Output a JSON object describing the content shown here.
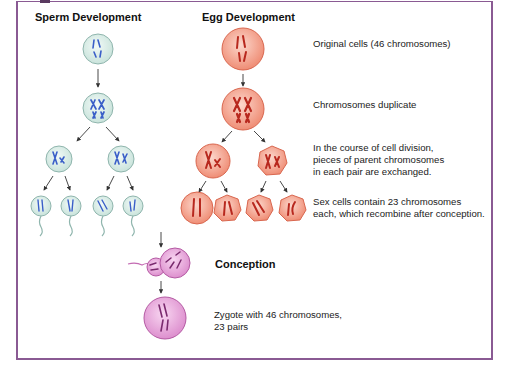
{
  "headings": {
    "sperm": "Sperm Development",
    "egg": "Egg Development",
    "conception": "Conception"
  },
  "steps": [
    {
      "lines": [
        "Original cells (46 chromosomes)"
      ]
    },
    {
      "lines": [
        "Chromosomes duplicate"
      ]
    },
    {
      "lines": [
        "In the course of cell division,",
        "pieces of parent chromosomes",
        "in each pair are exchanged."
      ]
    },
    {
      "lines": [
        "Sex cells contain 23 chromosomes",
        "each, which recombine after conception."
      ]
    }
  ],
  "zygote": {
    "lines": [
      "Zygote with 46 chromosomes,",
      "23 pairs"
    ]
  },
  "colors": {
    "frame": "#8a5a93",
    "sperm_cell_fill": "#dcefe8",
    "sperm_cell_stroke": "#8fb5ad",
    "sperm_chromosome": "#3a5fc8",
    "egg_cell_fill": "#f4a793",
    "egg_cell_stroke": "#d9674f",
    "egg_chromosome": "#b8281e",
    "zygote_fill": "#e9a6dc",
    "zygote_stroke": "#b45aa3",
    "zygote_chromosome": "#7a2a6e"
  }
}
